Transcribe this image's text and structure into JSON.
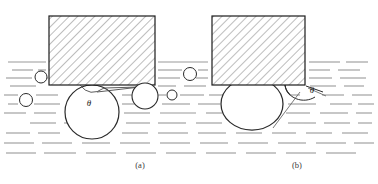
{
  "figure": {
    "width": 378,
    "height": 184,
    "background": "#ffffff",
    "colors": {
      "outline": "#1c1c1c",
      "hatch": "#8c8c8c",
      "liquid_line": "#9a9a9a",
      "bubble_outline": "#2a2a2a",
      "caption": "#3a3a3a",
      "background": "#ffffff"
    },
    "angle_symbol": "θ",
    "panels": [
      {
        "id": "a",
        "caption": "(a)",
        "caption_x": 140,
        "caption_y": 167,
        "block": {
          "x": 49,
          "y": 16,
          "width": 106,
          "height": 69
        },
        "main_bubble": {
          "shape": "sphere",
          "cx": 92,
          "cy": 112,
          "r": 27,
          "contact_half_width": 12,
          "note": "large near-spherical bubble making small contact area with solid"
        },
        "theta_label": {
          "x": 89,
          "y": 105,
          "text": "θ"
        },
        "bubbles": [
          {
            "cx": 145,
            "cy": 96,
            "r": 13
          },
          {
            "cx": 41,
            "cy": 77,
            "r": 6
          },
          {
            "cx": 26,
            "cy": 100,
            "r": 6.5
          },
          {
            "cx": 172,
            "cy": 95,
            "r": 5
          },
          {
            "cx": 190,
            "cy": 74,
            "r": 6.5
          }
        ]
      },
      {
        "id": "b",
        "caption": "(b)",
        "caption_x": 297,
        "caption_y": 167,
        "block": {
          "x": 212,
          "y": 16,
          "width": 93,
          "height": 69
        },
        "main_bubble": {
          "shape": "flattened-cap",
          "cx": 252,
          "cy": 104,
          "rx": 31,
          "ry": 26,
          "contact_half_width": 31,
          "note": "flattened bubble spread over the solid surface, large contact area"
        },
        "theta_label": {
          "x": 313,
          "y": 92,
          "text": "θ"
        },
        "bubbles": []
      }
    ],
    "liquid": {
      "surface_y": 62,
      "line_style": "horizontal dashed strokes representing liquid",
      "rows_y": [
        62,
        70,
        78,
        86,
        95,
        104,
        113,
        123,
        133,
        143,
        153
      ]
    }
  }
}
